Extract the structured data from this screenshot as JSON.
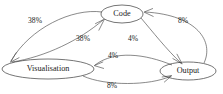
{
  "diagram": {
    "type": "directed-graph",
    "title": "",
    "background_color": "#ffffff",
    "node_stroke_color": "#3a3a3a",
    "edge_stroke_color": "#4a4a4a",
    "text_color": "#1a1a1a",
    "nodes": [
      {
        "id": "code",
        "label": "Code",
        "x": 122,
        "y": 14,
        "rx": 21,
        "ry": 9
      },
      {
        "id": "visualisation",
        "label": "Visualisation",
        "x": 48,
        "y": 69,
        "rx": 46,
        "ry": 10
      },
      {
        "id": "output",
        "label": "Output",
        "x": 188,
        "y": 71,
        "rx": 28,
        "ry": 9
      }
    ],
    "edges": [
      {
        "id": "code-to-visualisation",
        "from": "code",
        "to": "visualisation",
        "label": "38%",
        "label_x": 35,
        "label_y": 21
      },
      {
        "id": "visualisation-to-code",
        "from": "visualisation",
        "to": "code",
        "label": "38%",
        "label_x": 83,
        "label_y": 39
      },
      {
        "id": "code-to-output",
        "from": "code",
        "to": "output",
        "label": "4%",
        "label_x": 133,
        "label_y": 39
      },
      {
        "id": "output-to-code",
        "from": "output",
        "to": "code",
        "label": "8%",
        "label_x": 183,
        "label_y": 21
      },
      {
        "id": "output-to-visualisation",
        "from": "output",
        "to": "visualisation",
        "label": "4%",
        "label_x": 113,
        "label_y": 56
      },
      {
        "id": "visualisation-to-output",
        "from": "visualisation",
        "to": "output",
        "label": "8%",
        "label_x": 112,
        "label_y": 86
      }
    ]
  }
}
